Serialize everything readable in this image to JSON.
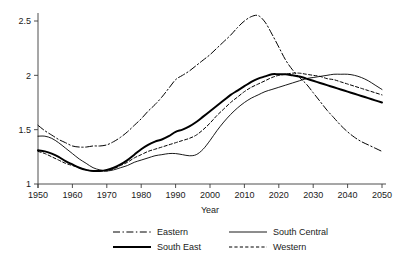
{
  "chart_data": {
    "type": "line",
    "title": "",
    "xlabel": "Year",
    "ylabel": "",
    "xlim": [
      1950,
      2050
    ],
    "ylim": [
      1.0,
      2.6
    ],
    "grid": false,
    "legend_position": "bottom",
    "x_ticks": [
      1950,
      1960,
      1970,
      1980,
      1990,
      2000,
      2010,
      2020,
      2030,
      2040,
      2050
    ],
    "x_tick_labels": [
      "1950",
      "1960",
      "1970",
      "1980",
      "1990",
      "2000",
      "2010",
      "2020",
      "2030",
      "2040",
      "2050"
    ],
    "y_ticks": [
      1,
      1.5,
      2,
      2.5
    ],
    "y_tick_labels": [
      "1",
      "1.5",
      "2",
      "2.5"
    ],
    "x": [
      1950,
      1952,
      1954,
      1956,
      1958,
      1960,
      1962,
      1964,
      1966,
      1968,
      1970,
      1972,
      1974,
      1976,
      1978,
      1980,
      1982,
      1984,
      1986,
      1988,
      1990,
      1992,
      1994,
      1996,
      1998,
      2000,
      2002,
      2004,
      2006,
      2008,
      2010,
      2012,
      2014,
      2016,
      2018,
      2020,
      2022,
      2024,
      2026,
      2028,
      2030,
      2032,
      2034,
      2036,
      2038,
      2040,
      2042,
      2044,
      2046,
      2048,
      2050
    ],
    "series": [
      {
        "name": "Eastern",
        "style": "dash-dot",
        "width": 1.0,
        "color": "#000000",
        "values": [
          1.54,
          1.49,
          1.45,
          1.41,
          1.38,
          1.35,
          1.34,
          1.34,
          1.35,
          1.35,
          1.36,
          1.39,
          1.43,
          1.48,
          1.54,
          1.6,
          1.67,
          1.73,
          1.8,
          1.88,
          1.96,
          2.0,
          2.04,
          2.09,
          2.14,
          2.19,
          2.25,
          2.31,
          2.37,
          2.44,
          2.5,
          2.54,
          2.55,
          2.49,
          2.38,
          2.26,
          2.14,
          2.05,
          1.98,
          1.92,
          1.84,
          1.76,
          1.68,
          1.61,
          1.54,
          1.48,
          1.43,
          1.39,
          1.36,
          1.33,
          1.3
        ]
      },
      {
        "name": "South East",
        "style": "solid-thick",
        "width": 2.0,
        "color": "#000000",
        "values": [
          1.31,
          1.3,
          1.28,
          1.25,
          1.21,
          1.18,
          1.15,
          1.13,
          1.12,
          1.12,
          1.13,
          1.15,
          1.18,
          1.22,
          1.27,
          1.32,
          1.36,
          1.39,
          1.41,
          1.44,
          1.48,
          1.5,
          1.53,
          1.57,
          1.62,
          1.67,
          1.72,
          1.77,
          1.82,
          1.86,
          1.9,
          1.94,
          1.97,
          1.99,
          2.01,
          2.01,
          2.01,
          2.0,
          1.99,
          1.97,
          1.95,
          1.93,
          1.91,
          1.89,
          1.87,
          1.85,
          1.83,
          1.81,
          1.79,
          1.77,
          1.75
        ]
      },
      {
        "name": "South Central",
        "style": "solid-thin",
        "width": 0.9,
        "color": "#000000",
        "values": [
          1.44,
          1.44,
          1.42,
          1.38,
          1.33,
          1.28,
          1.23,
          1.19,
          1.15,
          1.13,
          1.12,
          1.13,
          1.15,
          1.17,
          1.2,
          1.22,
          1.24,
          1.26,
          1.27,
          1.28,
          1.28,
          1.27,
          1.26,
          1.27,
          1.32,
          1.4,
          1.49,
          1.57,
          1.64,
          1.7,
          1.75,
          1.79,
          1.82,
          1.85,
          1.87,
          1.89,
          1.91,
          1.93,
          1.95,
          1.97,
          1.98,
          1.99,
          2.0,
          2.01,
          2.01,
          2.01,
          2.0,
          1.98,
          1.95,
          1.91,
          1.87
        ]
      },
      {
        "name": "Western",
        "style": "dashed",
        "width": 1.0,
        "color": "#000000",
        "values": [
          1.3,
          1.28,
          1.25,
          1.22,
          1.19,
          1.17,
          1.15,
          1.13,
          1.12,
          1.12,
          1.12,
          1.14,
          1.17,
          1.2,
          1.24,
          1.27,
          1.3,
          1.32,
          1.34,
          1.36,
          1.38,
          1.4,
          1.42,
          1.45,
          1.5,
          1.56,
          1.63,
          1.69,
          1.75,
          1.8,
          1.85,
          1.89,
          1.92,
          1.95,
          1.98,
          2.0,
          2.01,
          2.02,
          2.02,
          2.01,
          2.0,
          1.99,
          1.97,
          1.96,
          1.94,
          1.92,
          1.9,
          1.88,
          1.86,
          1.84,
          1.82
        ]
      }
    ],
    "legend": [
      {
        "label": "Eastern",
        "style": "dash-dot",
        "width": 1.0
      },
      {
        "label": "South Central",
        "style": "solid-thin",
        "width": 0.9
      },
      {
        "label": "South East",
        "style": "solid-thick",
        "width": 2.0
      },
      {
        "label": "Western",
        "style": "dashed",
        "width": 1.0
      }
    ]
  }
}
